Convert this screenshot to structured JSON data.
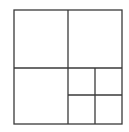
{
  "diagram": {
    "type": "quadtree-subdivision",
    "line_color": "#3a3a3a",
    "line_width": 1.3,
    "background": "#ffffff",
    "outer_box": {
      "x": 14,
      "y": 10,
      "width": 108,
      "height": 114
    },
    "lines": [
      {
        "id": "vertical-main-divider",
        "x1": 68,
        "y1": 10,
        "x2": 68,
        "y2": 124
      },
      {
        "id": "horizontal-main-divider",
        "x1": 14,
        "y1": 68,
        "x2": 122,
        "y2": 68
      },
      {
        "id": "vertical-sub-divider",
        "x1": 95,
        "y1": 68,
        "x2": 95,
        "y2": 124
      },
      {
        "id": "horizontal-sub-divider",
        "x1": 68,
        "y1": 95,
        "x2": 122,
        "y2": 95
      }
    ],
    "cells": [
      {
        "id": "top-left",
        "x": 14,
        "y": 10,
        "width": 54,
        "height": 58
      },
      {
        "id": "top-right",
        "x": 68,
        "y": 10,
        "width": 54,
        "height": 58
      },
      {
        "id": "bottom-left",
        "x": 14,
        "y": 68,
        "width": 54,
        "height": 56
      },
      {
        "id": "bottom-right-top-left",
        "x": 68,
        "y": 68,
        "width": 27,
        "height": 27
      },
      {
        "id": "bottom-right-top-right",
        "x": 95,
        "y": 68,
        "width": 27,
        "height": 27
      },
      {
        "id": "bottom-right-bottom-left",
        "x": 68,
        "y": 95,
        "width": 27,
        "height": 29
      },
      {
        "id": "bottom-right-bottom-right",
        "x": 95,
        "y": 95,
        "width": 27,
        "height": 29
      }
    ]
  }
}
